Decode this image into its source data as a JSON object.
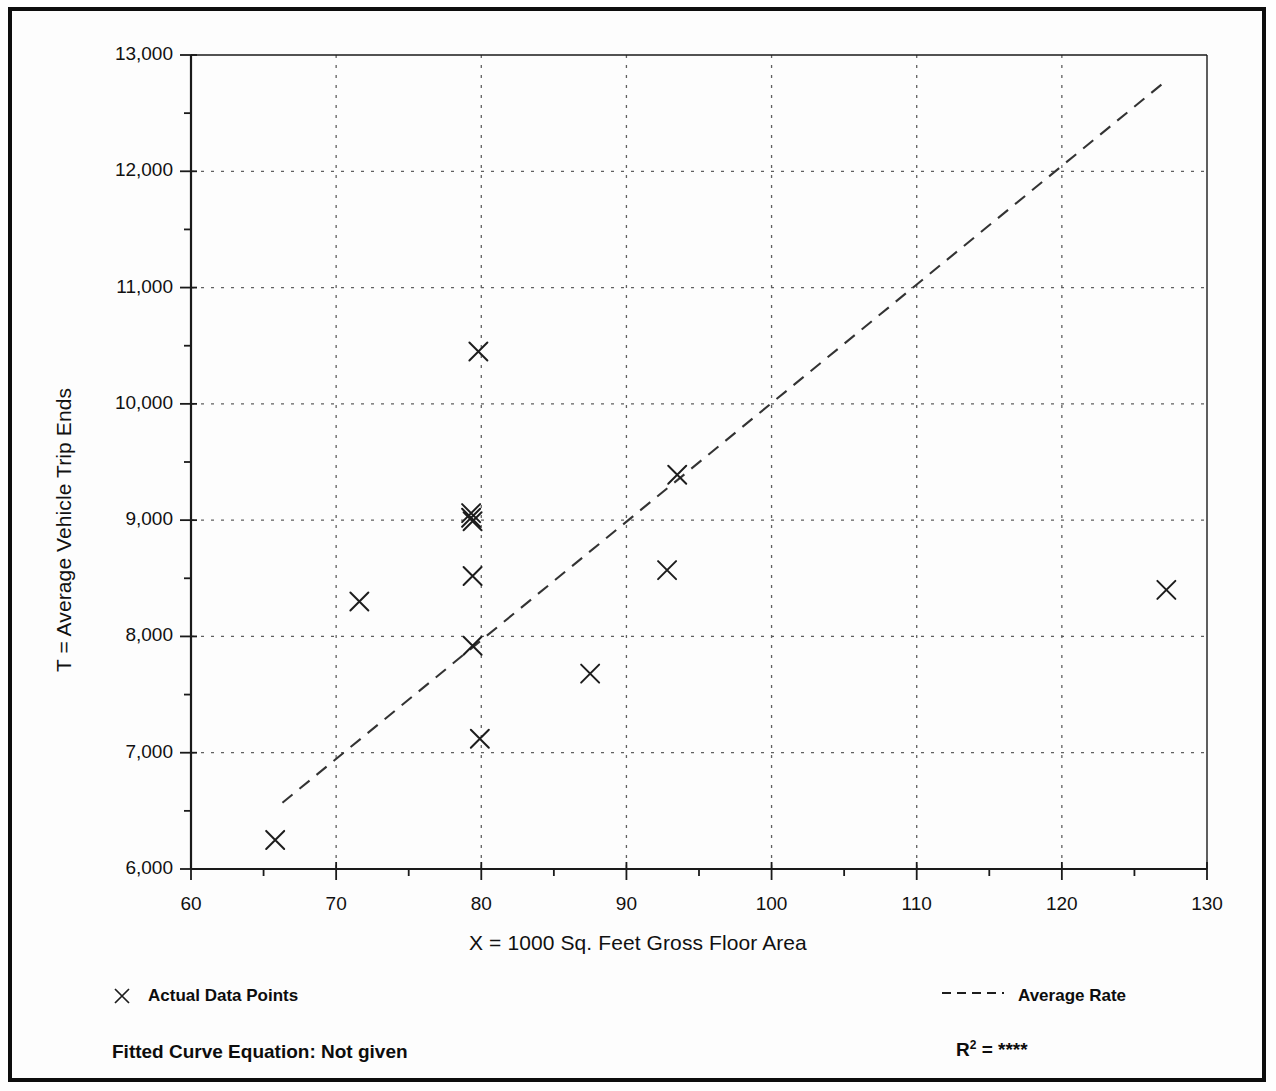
{
  "chart_data": {
    "type": "scatter",
    "title": "",
    "xlabel": "X = 1000 Sq. Feet Gross Floor Area",
    "ylabel": "T = Average Vehicle Trip Ends",
    "xlim": [
      60,
      130
    ],
    "ylim": [
      6000,
      13000
    ],
    "x_major_ticks": [
      60,
      70,
      80,
      90,
      100,
      110,
      120,
      130
    ],
    "x_tick_labels": [
      "60",
      "70",
      "80",
      "90",
      "100",
      "110",
      "120",
      "130"
    ],
    "x_minor_step": 5,
    "y_major_ticks": [
      6000,
      7000,
      8000,
      9000,
      10000,
      11000,
      12000,
      13000
    ],
    "y_tick_labels": [
      "6,000",
      "7,000",
      "8,000",
      "9,000",
      "10,000",
      "11,000",
      "12,000",
      "13,000"
    ],
    "y_minor_step": 500,
    "grid": "dotted-both",
    "legend_position": "below-plot",
    "marker": "x-cross",
    "series": [
      {
        "name": "Actual Data Points",
        "type": "scatter",
        "points": [
          {
            "x": 65.8,
            "y": 6250
          },
          {
            "x": 71.6,
            "y": 8300
          },
          {
            "x": 79.3,
            "y": 9060
          },
          {
            "x": 79.3,
            "y": 9020
          },
          {
            "x": 79.4,
            "y": 8990
          },
          {
            "x": 79.8,
            "y": 10450
          },
          {
            "x": 79.4,
            "y": 8520
          },
          {
            "x": 79.4,
            "y": 7920
          },
          {
            "x": 79.9,
            "y": 7120
          },
          {
            "x": 87.5,
            "y": 7680
          },
          {
            "x": 92.8,
            "y": 8570
          },
          {
            "x": 93.5,
            "y": 9390
          },
          {
            "x": 127.2,
            "y": 8400
          }
        ]
      },
      {
        "name": "Average Rate",
        "type": "line",
        "style": "dashed",
        "endpoints": [
          {
            "x": 66.3,
            "y": 6570
          },
          {
            "x": 127.0,
            "y": 12760
          }
        ]
      }
    ]
  },
  "axis_titles": {
    "y": "T = Average Vehicle Trip Ends",
    "x": "X = 1000 Sq. Feet Gross Floor Area"
  },
  "legend": {
    "data_points_label": "Actual Data Points",
    "average_rate_label": "Average Rate",
    "data_points_marker": "x-marker-icon",
    "average_rate_marker": "dashed-line-icon"
  },
  "footer": {
    "fitted_curve_label": "Fitted Curve Equation:  Not given",
    "r2_label": "R",
    "r2_exponent": "2",
    "r2_equals": " = ",
    "r2_value": "****"
  },
  "colors": {
    "ink": "#0d0d0d",
    "grid": "#555555",
    "axis": "#1a1a1a",
    "background": "#fdfdfd"
  }
}
